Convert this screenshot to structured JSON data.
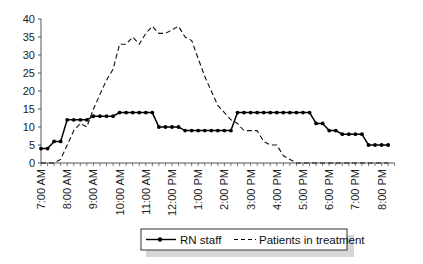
{
  "chart_data": {
    "type": "line",
    "title": "",
    "xlabel": "",
    "ylabel": "",
    "ylim": [
      0,
      40
    ],
    "yticks": [
      0,
      5,
      10,
      15,
      20,
      25,
      30,
      35,
      40
    ],
    "grid": false,
    "legend_position": "bottom",
    "x_tick_labels": [
      "7:00 AM",
      "8:00 AM",
      "9:00 AM",
      "10:00 AM",
      "11:00 AM",
      "12:00 PM",
      "1:00 PM",
      "2:00 PM",
      "3:00 PM",
      "4:00 PM",
      "5:00 PM",
      "6:00 PM",
      "7:00 PM",
      "8:00 PM"
    ],
    "x_interval": "15 min",
    "series": [
      {
        "name": "RN staff",
        "style": "solid-with-markers",
        "values": [
          4,
          4,
          6,
          6,
          12,
          12,
          12,
          12,
          13,
          13,
          13,
          13,
          14,
          14,
          14,
          14,
          14,
          14,
          10,
          10,
          10,
          10,
          9,
          9,
          9,
          9,
          9,
          9,
          9,
          9,
          14,
          14,
          14,
          14,
          14,
          14,
          14,
          14,
          14,
          14,
          14,
          14,
          11,
          11,
          9,
          9,
          8,
          8,
          8,
          8,
          5,
          5,
          5,
          5
        ]
      },
      {
        "name": "Patients in treatment",
        "style": "dashed",
        "values": [
          0,
          0,
          0,
          1,
          5,
          9,
          11,
          10,
          15,
          19,
          23,
          26,
          33,
          33,
          35,
          33,
          36,
          38,
          36,
          36,
          37,
          38,
          35,
          34,
          29,
          24,
          20,
          16,
          14,
          12,
          11,
          9,
          9,
          9,
          6,
          5,
          5,
          2,
          1,
          0,
          0,
          0,
          0,
          0,
          0,
          0,
          0,
          0,
          0,
          0,
          0,
          0,
          0,
          0
        ]
      }
    ]
  },
  "legend": {
    "items": [
      {
        "label": "RN staff"
      },
      {
        "label": "Patients in treatment"
      }
    ]
  }
}
